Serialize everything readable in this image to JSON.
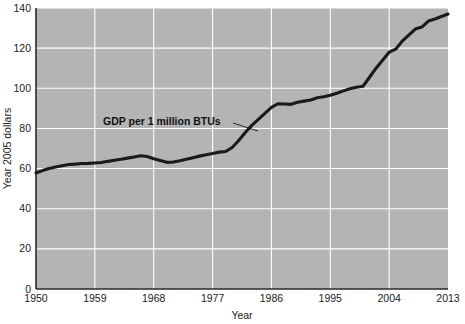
{
  "chart_data": {
    "type": "line",
    "title": "",
    "xlabel": "Year",
    "ylabel": "Year 2005 dollars",
    "xlim": [
      1950,
      2013
    ],
    "ylim": [
      0,
      140
    ],
    "xticks": [
      "1950",
      "1959",
      "1968",
      "1977",
      "1986",
      "1995",
      "2004",
      "2013"
    ],
    "xtick_values": [
      1950,
      1959,
      1968,
      1977,
      1986,
      1995,
      2004,
      2013
    ],
    "yticks": [
      "0",
      "20",
      "40",
      "60",
      "80",
      "100",
      "120",
      "140"
    ],
    "ytick_values": [
      0,
      20,
      40,
      60,
      80,
      100,
      120,
      140
    ],
    "grid": true,
    "grid_color": "#ffffff",
    "plot_background": "#b4b4b4",
    "legend": null,
    "series": [
      {
        "name": "GDP per 1 million BTUs",
        "color": "#1a1a1a",
        "x": [
          1950,
          1951,
          1952,
          1953,
          1954,
          1955,
          1956,
          1957,
          1958,
          1959,
          1960,
          1961,
          1962,
          1963,
          1964,
          1965,
          1966,
          1967,
          1968,
          1969,
          1970,
          1971,
          1972,
          1973,
          1974,
          1975,
          1976,
          1977,
          1978,
          1979,
          1980,
          1981,
          1982,
          1983,
          1984,
          1985,
          1986,
          1987,
          1988,
          1989,
          1990,
          1991,
          1992,
          1993,
          1994,
          1995,
          1996,
          1997,
          1998,
          1999,
          2000,
          2001,
          2002,
          2003,
          2004,
          2005,
          2006,
          2007,
          2008,
          2009,
          2010,
          2011
        ],
        "values": [
          57.8,
          59.0,
          60.0,
          60.8,
          61.4,
          62.0,
          62.2,
          62.5,
          62.6,
          62.8,
          63.0,
          63.6,
          64.1,
          64.6,
          65.2,
          65.8,
          66.4,
          66.0,
          64.9,
          64.0,
          63.1,
          63.3,
          63.9,
          64.6,
          65.4,
          66.2,
          66.9,
          67.5,
          68.2,
          68.5,
          70.5,
          74.0,
          78.0,
          81.5,
          84.5,
          87.5,
          90.5,
          92.3,
          92.2,
          92.0,
          93.0,
          93.6,
          94.2,
          95.3,
          95.8,
          96.5,
          97.5,
          98.7,
          99.8,
          100.5,
          101.0,
          105.5,
          110.0,
          114.0,
          118.0,
          119.5,
          123.5,
          126.5,
          129.5,
          130.5,
          133.5,
          134.5
        ],
        "end_value": 137.0
      }
    ],
    "annotations": [
      {
        "text": "GDP per 1 million BTUs",
        "x_px": 103,
        "y_px": 125,
        "leader_from": [
          233,
          123
        ],
        "leader_to": [
          258,
          131
        ]
      }
    ]
  }
}
